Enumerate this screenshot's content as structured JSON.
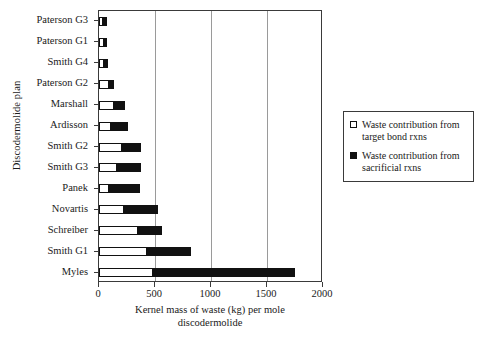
{
  "chart_data": {
    "type": "bar",
    "orientation": "horizontal",
    "stacked": true,
    "title": "",
    "xlabel": "Kernel mass of waste (kg) per mole discodermolide",
    "xlabel_line1": "Kernel mass of waste (kg) per mole",
    "xlabel_line2": "discodermolide",
    "ylabel": "Discodermolide plan",
    "xlim": [
      0,
      2000
    ],
    "xticks": [
      0,
      500,
      1000,
      1500,
      2000
    ],
    "xtick_labels": [
      "0",
      "500",
      "1000",
      "1500",
      "2000"
    ],
    "grid": "vertical",
    "legend_position": "right",
    "categories": [
      "Paterson G3",
      "Paterson G1",
      "Smith G4",
      "Paterson G2",
      "Marshall",
      "Ardisson",
      "Smith G2",
      "Smith G3",
      "Panek",
      "Novartis",
      "Schreiber",
      "Smith G1",
      "Myles"
    ],
    "series": [
      {
        "name": "Waste contribution from target bond rxns",
        "color": "#ffffff",
        "values": [
          40,
          45,
          45,
          90,
          135,
          110,
          205,
          160,
          90,
          225,
          350,
          430,
          480
        ]
      },
      {
        "name": "Waste contribution from sacrificial rxns",
        "color": "#111111",
        "values": [
          35,
          30,
          35,
          40,
          100,
          145,
          170,
          215,
          275,
          300,
          215,
          390,
          1270
        ]
      }
    ],
    "totals": [
      75,
      75,
      80,
      130,
      235,
      255,
      375,
      375,
      365,
      525,
      565,
      820,
      1750
    ]
  },
  "legend": {
    "items": [
      {
        "swatch": "white",
        "line1": "Waste contribution from",
        "line2": "target bond rxns"
      },
      {
        "swatch": "black",
        "line1": "Waste contribution from",
        "line2": "sacrificial rxns"
      }
    ]
  }
}
